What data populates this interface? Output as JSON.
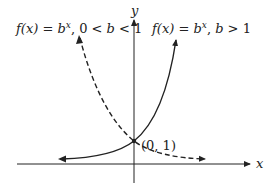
{
  "labels": {
    "decay_fx": "f(x)",
    "decay_eq": " = ",
    "decay_b": "b",
    "decay_exp": "x",
    "decay_cond": ", 0 < ",
    "decay_cond_b": "b",
    "decay_cond_end": " < 1",
    "growth_fx": "f(x)",
    "growth_eq": " = ",
    "growth_b": "b",
    "growth_exp": "x",
    "growth_cond": ", ",
    "growth_cond_b": "b",
    "growth_cond_end": " > 1",
    "point": "(0, 1)",
    "x_axis": "x",
    "y_axis": "y"
  },
  "colors": {
    "ink": "#222222",
    "background": "#ffffff"
  }
}
